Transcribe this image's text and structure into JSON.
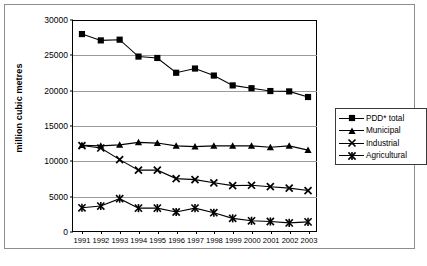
{
  "figure": {
    "ylabel": "million cubic metres",
    "caption": ""
  },
  "legend": {
    "items": [
      {
        "label": "PDD* total",
        "marker": "square-marker"
      },
      {
        "label": "Municipal",
        "marker": "triangle-marker"
      },
      {
        "label": "Industrial",
        "marker": "x-marker"
      },
      {
        "label": "Agricultural",
        "marker": "asterisk-marker"
      }
    ]
  },
  "chart_data": {
    "type": "line",
    "title": "",
    "xlabel": "",
    "ylabel": "million cubic metres",
    "xlim": [
      1991,
      2003
    ],
    "ylim": [
      0,
      30000
    ],
    "grid": true,
    "legend_position": "right",
    "categories": [
      "1991",
      "1992",
      "1993",
      "1994",
      "1995",
      "1996",
      "1997",
      "1998",
      "1999",
      "2000",
      "2001",
      "2002",
      "2003"
    ],
    "yticks": [
      "0",
      "5000",
      "10000",
      "15000",
      "20000",
      "25000",
      "30000"
    ],
    "ytick_values": [
      0,
      5000,
      10000,
      15000,
      20000,
      25000,
      30000
    ],
    "series": [
      {
        "name": "PDD* total",
        "marker": "square",
        "values": [
          28000,
          27100,
          27200,
          24800,
          24600,
          22500,
          23100,
          22100,
          20700,
          20300,
          19900,
          19850,
          19050
        ]
      },
      {
        "name": "Municipal",
        "marker": "triangle",
        "values": [
          12200,
          12100,
          12250,
          12600,
          12500,
          12100,
          12000,
          12100,
          12100,
          12100,
          11900,
          12100,
          11500
        ]
      },
      {
        "name": "Industrial",
        "marker": "x",
        "values": [
          12150,
          11800,
          10150,
          8650,
          8650,
          7450,
          7300,
          6850,
          6450,
          6500,
          6300,
          6100,
          5750
        ]
      },
      {
        "name": "Agricultural",
        "marker": "asterisk",
        "values": [
          3300,
          3550,
          4600,
          3250,
          3250,
          2700,
          3250,
          2600,
          1800,
          1450,
          1350,
          1150,
          1300
        ]
      }
    ]
  }
}
